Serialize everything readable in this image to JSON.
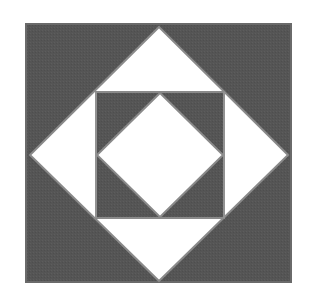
{
  "figure": {
    "type": "quilt-block-pattern",
    "description": "Square within a square geometric block",
    "colors": {
      "background": "#ffffff",
      "dark_fill": "#555555",
      "light_fill": "#ffffff",
      "seam": "#8a8a8a",
      "border": "#6a6a6a"
    },
    "outer_square": {
      "x": 26,
      "y": 24,
      "width": 265,
      "height": 258
    },
    "outer_diamond": {
      "points": "159,27 288,155 159,281 30,155"
    },
    "inner_square": {
      "x": 96,
      "y": 92,
      "width": 128,
      "height": 126
    },
    "inner_diamond": {
      "points": "160,93 223,155 160,217 97,155"
    }
  }
}
